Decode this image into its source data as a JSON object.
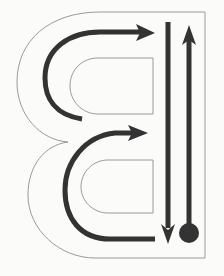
{
  "diagram": {
    "title": "Letter B stroke order guide",
    "colors": {
      "background": "#fbfbfa",
      "outline": "#9a9a9a",
      "stroke": "#333333"
    },
    "strokes": [
      {
        "id": "upper-curve",
        "direction": "left-to-right arrow, curving over top bowl"
      },
      {
        "id": "lower-curve",
        "direction": "left-to-right arrow, curving over bottom bowl"
      },
      {
        "id": "down-line",
        "direction": "vertical arrow pointing down"
      },
      {
        "id": "up-line",
        "direction": "vertical arrow pointing up from start dot"
      }
    ],
    "start_marker": "start-dot"
  }
}
